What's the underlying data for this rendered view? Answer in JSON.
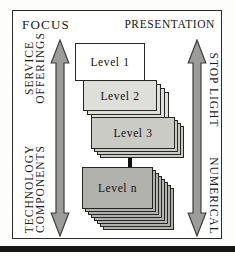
{
  "frame": {
    "focus_label": "FOCUS",
    "presentation_label": "PRESENTATION"
  },
  "side_labels": {
    "left_top": [
      "SERVICE",
      "OFFERINGS"
    ],
    "left_bottom": [
      "TECHNOLOGY",
      "COMPONENTS"
    ],
    "right_top": [
      "STOP LIGHT"
    ],
    "right_bottom": [
      "NUMERICAL"
    ]
  },
  "levels": [
    {
      "id": "1",
      "label": "Level 1",
      "cards": 1,
      "step": 0,
      "fill": "#ffffff",
      "x": 62,
      "y": 32,
      "w": 70,
      "h": 38,
      "z": 40
    },
    {
      "id": "2",
      "label": "Level 2",
      "cards": 4,
      "step": 4,
      "fill": "#dededa",
      "x": 70,
      "y": 69,
      "w": 74,
      "h": 31,
      "z": 10
    },
    {
      "id": "3",
      "label": "Level 3",
      "cards": 4,
      "step": 3,
      "fill": "#cbcbc6",
      "x": 78,
      "y": 106,
      "w": 84,
      "h": 32,
      "z": 20
    },
    {
      "id": "n",
      "label": "Level n",
      "cards": 8,
      "step": 3,
      "fill": "#b1b1ad",
      "x": 69,
      "y": 156,
      "w": 71,
      "h": 42,
      "z": 30
    }
  ],
  "colors": {
    "arrow_fill": "#9c9c9a",
    "arrow_stroke": "#3f3f3d",
    "card_border": "#262626",
    "connector": "#101010",
    "bottom_rule": "#161616"
  }
}
